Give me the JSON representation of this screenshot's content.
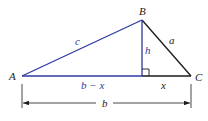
{
  "diagram": {
    "type": "triangle-altitude",
    "colors": {
      "blue": "#2d3aa0",
      "black": "#1a1a1a"
    },
    "vertices": {
      "A": {
        "label": "A",
        "x": 22,
        "y": 76
      },
      "B": {
        "label": "B",
        "x": 142,
        "y": 20
      },
      "C": {
        "label": "C",
        "x": 191,
        "y": 76
      }
    },
    "foot": {
      "x": 142,
      "y": 76
    },
    "labels": {
      "side_c": "c",
      "side_a": "a",
      "height": "h",
      "b_minus_x": "b − x",
      "x": "x",
      "b": "b"
    }
  }
}
